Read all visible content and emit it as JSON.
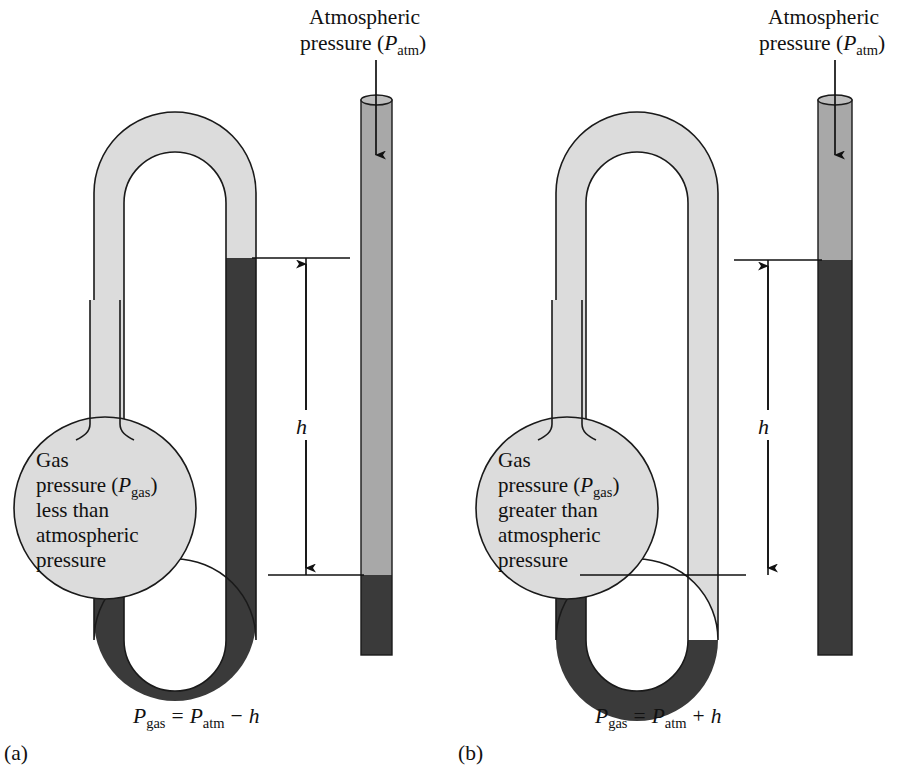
{
  "figure": {
    "title_visible": false,
    "background_color": "#ffffff",
    "mercury_color": "#3a3a3a",
    "glass_color": "#dcdcdc",
    "atmosphere_fill_color": "#a8a8a8",
    "outline_color": "#1a1a1a"
  },
  "panels": [
    {
      "id": "a",
      "panel_label": "(a)",
      "atmos_label_line1": "Atmospheric",
      "atmos_label_line2_pre": "pressure (",
      "atmos_label_italic": "P",
      "atmos_label_sub": "atm",
      "atmos_label_line2_post": ")",
      "bulb_lines": [
        "Gas",
        "pressure (Pgas)",
        "less than",
        "atmospheric",
        "pressure"
      ],
      "bulb_text": {
        "l1": "Gas",
        "l2_pre": "pressure (",
        "l2_italic": "P",
        "l2_sub": "gas",
        "l2_post": ")",
        "l3": "less than",
        "l4": "atmospheric",
        "l5": "pressure"
      },
      "height_label": "h",
      "equation": {
        "lhs_italic": "P",
        "lhs_sub": "gas",
        "operator_eq": "=",
        "rhs_italic": "P",
        "rhs_sub": "atm",
        "operator_sign": "−",
        "rhs_h": "h",
        "plain": "Pgas = Patm − h"
      },
      "mercury_level_left_tube_y": 258,
      "mercury_level_right_tube_y": 575,
      "relation": "less than"
    },
    {
      "id": "b",
      "panel_label": "(b)",
      "atmos_label_line1": "Atmospheric",
      "atmos_label_line2_pre": "pressure (",
      "atmos_label_italic": "P",
      "atmos_label_sub": "atm",
      "atmos_label_line2_post": ")",
      "bulb_lines": [
        "Gas",
        "pressure (Pgas)",
        "greater than",
        "atmospheric",
        "pressure"
      ],
      "bulb_text": {
        "l1": "Gas",
        "l2_pre": "pressure (",
        "l2_italic": "P",
        "l2_sub": "gas",
        "l2_post": ")",
        "l3": "greater than",
        "l4": "atmospheric",
        "l5": "pressure"
      },
      "height_label": "h",
      "equation": {
        "lhs_italic": "P",
        "lhs_sub": "gas",
        "operator_eq": "=",
        "rhs_italic": "P",
        "rhs_sub": "atm",
        "operator_sign": "+",
        "rhs_h": "h",
        "plain": "Pgas = Patm + h"
      },
      "mercury_level_left_tube_y": 575,
      "mercury_level_right_tube_y": 260,
      "relation": "greater than"
    }
  ]
}
